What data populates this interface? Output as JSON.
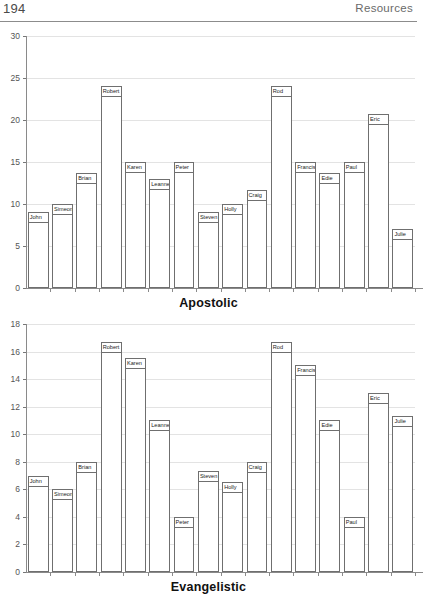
{
  "page": {
    "number": "194",
    "section": "Resources"
  },
  "chart_data": [
    {
      "id": "apostolic",
      "type": "bar",
      "title": "Apostolic",
      "xlabel": "",
      "ylabel": "",
      "ylim": [
        0,
        30
      ],
      "ytick_step": 5,
      "yticks": [
        "0",
        "5",
        "10",
        "15",
        "20",
        "25",
        "30"
      ],
      "grid": true,
      "legend": "none",
      "categories": [
        "John",
        "Simeon",
        "Brian",
        "Robert",
        "Karen",
        "Leanne",
        "Peter",
        "Steven",
        "Holly",
        "Craig",
        "Rod",
        "Francis",
        "Edie",
        "Paul",
        "Eric",
        "Julie"
      ],
      "values": [
        9,
        10,
        13.7,
        24,
        15,
        13,
        15,
        9,
        10,
        11.7,
        24,
        15,
        13.7,
        15,
        20.7,
        7
      ]
    },
    {
      "id": "evangelistic",
      "type": "bar",
      "title": "Evangelistic",
      "xlabel": "",
      "ylabel": "",
      "ylim": [
        0,
        18
      ],
      "ytick_step": 2,
      "yticks": [
        "0",
        "2",
        "4",
        "6",
        "8",
        "10",
        "12",
        "14",
        "16",
        "18"
      ],
      "grid": true,
      "legend": "none",
      "categories": [
        "John",
        "Simeon",
        "Brian",
        "Robert",
        "Karen",
        "Leanne",
        "Peter",
        "Steven",
        "Holly",
        "Craig",
        "Rod",
        "Francis",
        "Edie",
        "Paul",
        "Eric",
        "Julie"
      ],
      "values": [
        7,
        6,
        8,
        16.7,
        15.5,
        11,
        4,
        7.3,
        6.5,
        8,
        16.7,
        15,
        11,
        4,
        13,
        11.3
      ]
    }
  ],
  "colors": {
    "bar_fill": "#ffffff",
    "bar_stroke": "#6f6f6f",
    "axis": "#8a8a8a",
    "grid": "#e3e3e3",
    "header_rule": "#8c8c8c",
    "text": "#1a1a1a"
  }
}
